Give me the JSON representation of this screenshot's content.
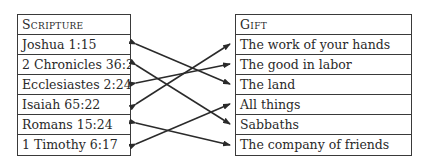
{
  "left_table": {
    "header": "Scripture",
    "items": [
      "Joshua 1:15",
      "2 Chronicles 36:21",
      "Ecclesiastes 2:24",
      "Isaiah 65:22",
      "Romans 15:24",
      "1 Timothy 6:17"
    ]
  },
  "right_table": {
    "header": "Gift",
    "items": [
      "The work of your hands",
      "The good in labor",
      "The land",
      "All things",
      "Sabbaths",
      "The company of friends"
    ]
  },
  "connections": [
    {
      "from": "Joshua 1:15",
      "to": "The land"
    },
    {
      "from": "2 Chronicles 36:21",
      "to": "Sabbaths"
    },
    {
      "from": "Ecclesiastes 2:24",
      "to": "The good in labor"
    },
    {
      "from": "Isaiah 65:22",
      "to": "The work of your hands"
    },
    {
      "from": "Romans 15:24",
      "to": "The company of friends"
    },
    {
      "from": "1 Timothy 6:17",
      "to": "All things"
    }
  ]
}
